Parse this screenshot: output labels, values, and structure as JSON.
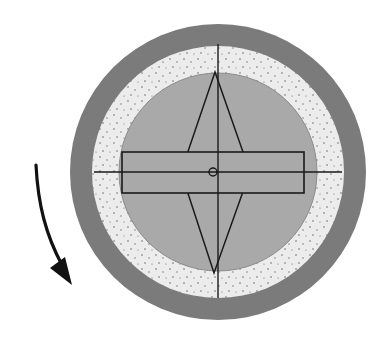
{
  "diagram": {
    "type": "rotating-disc-schematic",
    "center": {
      "x": 218,
      "y": 172
    },
    "colors": {
      "background": "#ffffff",
      "outer_ring": "#7b7b7b",
      "speckled_ring": "#ececec",
      "speckle_dots": "#6a6a6a",
      "inner_disc": "#a9a9a9",
      "stroke": "#1a1a1a"
    },
    "rings": [
      {
        "name": "outer-ring",
        "radius": 148
      },
      {
        "name": "speckled-ring",
        "radius": 126
      },
      {
        "name": "inner-disc",
        "radius": 99
      }
    ],
    "crosshair": {
      "vertical": {
        "x": 218,
        "y1": 44,
        "y2": 298
      },
      "horizontal": {
        "y": 172,
        "x1": 94,
        "x2": 342
      }
    },
    "diamond": {
      "top": {
        "x": 215,
        "y": 72
      },
      "bottom": {
        "x": 214,
        "y": 273
      },
      "left": {
        "x": 181,
        "y": 172
      },
      "right": {
        "x": 250,
        "y": 172
      }
    },
    "bar": {
      "x": 122,
      "y": 152,
      "width": 182,
      "height": 41
    },
    "pivot": {
      "x": 213,
      "y": 172,
      "r": 4
    },
    "rotation_arrow": {
      "direction": "counterclockwise-downward",
      "path": "M36 165 C 38 205, 46 235, 62 265",
      "head": "72,285 50,268 65,257"
    }
  }
}
